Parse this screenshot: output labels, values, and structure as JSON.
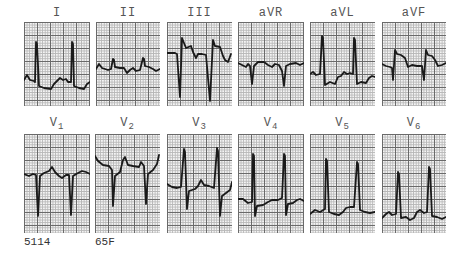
{
  "figure": {
    "rows": [
      {
        "leads": [
          {
            "id": "I",
            "label": "I",
            "sub": ""
          },
          {
            "id": "II",
            "label": "II",
            "sub": ""
          },
          {
            "id": "III",
            "label": "III",
            "sub": ""
          },
          {
            "id": "aVR",
            "label": "aVR",
            "sub": ""
          },
          {
            "id": "aVL",
            "label": "aVL",
            "sub": ""
          },
          {
            "id": "aVF",
            "label": "aVF",
            "sub": ""
          }
        ]
      },
      {
        "leads": [
          {
            "id": "V1",
            "label": "V",
            "sub": "1"
          },
          {
            "id": "V2",
            "label": "V",
            "sub": "2"
          },
          {
            "id": "V3",
            "label": "V",
            "sub": "3"
          },
          {
            "id": "V4",
            "label": "V",
            "sub": "4"
          },
          {
            "id": "V5",
            "label": "V",
            "sub": "5"
          },
          {
            "id": "V6",
            "label": "V",
            "sub": "6"
          }
        ]
      }
    ]
  },
  "footer": {
    "case_number": "5114",
    "patient": "65F"
  }
}
